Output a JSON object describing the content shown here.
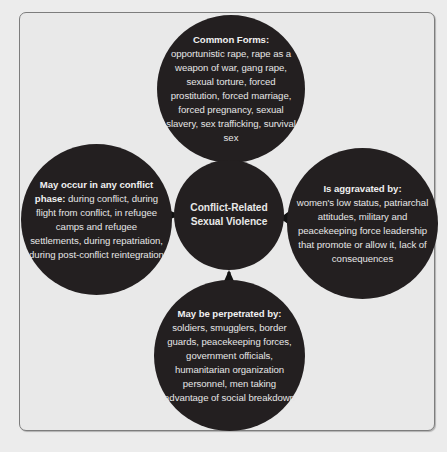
{
  "diagram": {
    "center": {
      "title_line1": "Conflict-Related",
      "title_line2": "Sexual Violence"
    },
    "nodes": {
      "top": {
        "heading": "Common Forms:",
        "body": "opportunistic rape, rape as a weapon of war, gang rape, sexual torture, forced prostitution, forced marriage, forced pregnancy, sexual slavery, sex trafficking, survival sex"
      },
      "left": {
        "heading": "May occur in any conflict phase:",
        "body": " during conflict, during flight from conflict, in refugee camps and refugee settlements, during repatriation, during post-conflict reintegration"
      },
      "right": {
        "heading": "Is aggravated by:",
        "body": "women's low status, patriarchal attitudes, military and peacekeeping force leadership that promote or allow it, lack of consequences"
      },
      "bottom": {
        "heading": "May be perpetrated by:",
        "body": " soldiers, smugglers, border guards, peacekeeping forces, government officials, humanitarian organization personnel, men taking advantage of social breakdown"
      }
    },
    "arrows": [
      {
        "from": "top",
        "to": "center",
        "direction": "down"
      },
      {
        "from": "left",
        "to": "center",
        "direction": "right"
      },
      {
        "from": "right",
        "to": "center",
        "direction": "left"
      },
      {
        "from": "bottom",
        "to": "center",
        "direction": "up"
      }
    ],
    "colors": {
      "circle_fill": "#231f20",
      "circle_text": "#e6e6e6",
      "background": "#e9e9e9",
      "frame_border": "#7d7d7d",
      "arrow": "#111111"
    }
  }
}
